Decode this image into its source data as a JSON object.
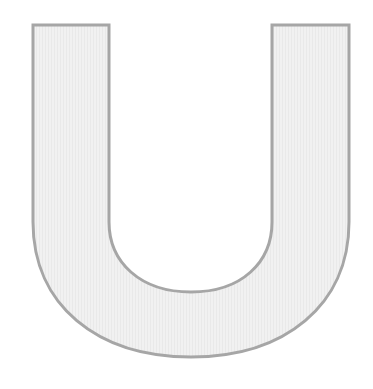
{
  "glyph": {
    "character": "U",
    "fill_color": "#efefef",
    "stroke_color": "#a6a6a6"
  }
}
